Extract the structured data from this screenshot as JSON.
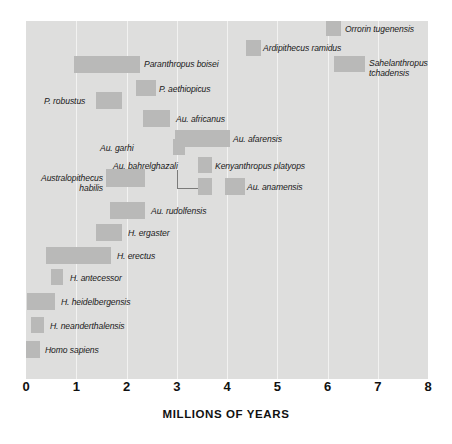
{
  "chart_data": {
    "type": "bar",
    "orientation": "horizontal-range",
    "title": "",
    "xlabel": "MILLIONS OF YEARS",
    "ylabel": "",
    "xlim": [
      0,
      8
    ],
    "x_ticks": [
      0,
      1,
      2,
      3,
      4,
      5,
      6,
      7,
      8
    ],
    "x_tick_labels": [
      "0",
      "1",
      "2",
      "3",
      "4",
      "5",
      "6",
      "7",
      "8"
    ],
    "grid": true,
    "grid_axis": "x",
    "legend": "none",
    "note": "Each bar is a temporal range (start = younger, end = older) in millions of years before present; the x axis increases to the right toward older dates.",
    "colors": {
      "plot_background": "#dededd",
      "bar_fill": "#b9b9b8",
      "gridline": "#f2f2f1",
      "text": "#1a1a1a",
      "axis_text": "#111111",
      "connector": "#7b7b7a",
      "page_background": "#ffffff"
    },
    "categories": [
      "Orrorin tugenensis",
      "Ardipithecus ramidus",
      "Sahelanthropus tchadensis",
      "Paranthropus boisei",
      "P. aethiopicus",
      "P. robustus",
      "Au. africanus",
      "Au. afarensis",
      "Au. garhi",
      "Kenyanthropus platyops",
      "Au. bahrelghazali",
      "Australopithecus habilis",
      "Au. anamensis",
      "Au. rudolfensis",
      "H. ergaster",
      "H. erectus",
      "H. antecessor",
      "H. heidelbergensis",
      "H. neanderthalensis",
      "Homo sapiens"
    ],
    "bars": [
      {
        "name": "Orrorin tugenensis",
        "start": 5.98,
        "end": 6.28
      },
      {
        "name": "Ardipithecus ramidus",
        "start": 4.38,
        "end": 4.68
      },
      {
        "name": "Sahelanthropus tchadensis",
        "start": 6.14,
        "end": 6.76
      },
      {
        "name": "Paranthropus boisei",
        "start": 0.96,
        "end": 2.27
      },
      {
        "name": "P. aethiopicus",
        "start": 2.19,
        "end": 2.59
      },
      {
        "name": "P. robustus",
        "start": 1.39,
        "end": 1.91
      },
      {
        "name": "Au. africanus",
        "start": 2.33,
        "end": 2.87
      },
      {
        "name": "Au. afarensis",
        "start": 2.97,
        "end": 4.06
      },
      {
        "name": "Au. garhi",
        "start": 2.93,
        "end": 3.17
      },
      {
        "name": "Kenyanthropus platyops",
        "start": 3.42,
        "end": 3.7
      },
      {
        "name": "Au. bahrelghazali",
        "start": 3.42,
        "end": 3.7
      },
      {
        "name": "Australopithecus habilis",
        "start": 1.59,
        "end": 2.37
      },
      {
        "name": "Au. anamensis",
        "start": 3.96,
        "end": 4.36
      },
      {
        "name": "Au. rudolfensis",
        "start": 1.67,
        "end": 2.37
      },
      {
        "name": "H. ergaster",
        "start": 1.39,
        "end": 1.91
      },
      {
        "name": "H. erectus",
        "start": 0.4,
        "end": 1.69
      },
      {
        "name": "H. antecessor",
        "start": 0.5,
        "end": 0.74
      },
      {
        "name": "H. heidelbergensis",
        "start": 0.02,
        "end": 0.58
      },
      {
        "name": "H. neanderthalensis",
        "start": 0.1,
        "end": 0.36
      },
      {
        "name": "Homo sapiens",
        "start": 0.0,
        "end": 0.28
      }
    ],
    "label_positions": [
      {
        "name": "Orrorin tugenensis",
        "left": 345,
        "top": 24,
        "align": "left",
        "lines": [
          "Orrorin tugenensis"
        ]
      },
      {
        "name": "Ardipithecus ramidus",
        "left": 263,
        "top": 43,
        "align": "left",
        "lines": [
          "Ardipithecus ramidus"
        ]
      },
      {
        "name": "Sahelanthropus tchadensis",
        "left": 369,
        "top": 58,
        "align": "left",
        "lines": [
          "Sahelanthropus",
          "tchadensis"
        ]
      },
      {
        "name": "Paranthropus boisei",
        "left": 144,
        "top": 59,
        "align": "left",
        "lines": [
          "Paranthropus boisei"
        ]
      },
      {
        "name": "P. aethiopicus",
        "left": 159,
        "top": 84,
        "align": "left",
        "lines": [
          "P. aethiopicus"
        ]
      },
      {
        "name": "P. robustus",
        "left": 44,
        "top": 96,
        "align": "left",
        "lines": [
          "P. robustus"
        ]
      },
      {
        "name": "Au. africanus",
        "left": 176,
        "top": 114,
        "align": "left",
        "lines": [
          "Au. africanus"
        ]
      },
      {
        "name": "Au. afarensis",
        "left": 233,
        "top": 134,
        "align": "left",
        "lines": [
          "Au. afarensis"
        ]
      },
      {
        "name": "Au. garhi",
        "left": 100,
        "top": 143,
        "align": "left",
        "lines": [
          "Au. garhi"
        ]
      },
      {
        "name": "Kenyanthropus platyops",
        "left": 215,
        "top": 161,
        "align": "left",
        "lines": [
          "Kenyanthropus platyops"
        ]
      },
      {
        "name": "Au. bahrelghazali",
        "left": 113,
        "top": 161,
        "align": "left",
        "lines": [
          "Au. bahrelghazali"
        ]
      },
      {
        "name": "Australopithecus habilis",
        "left": 31,
        "top": 173,
        "align": "right",
        "lines": [
          "Australopithecus",
          "habilis"
        ],
        "width": 72
      },
      {
        "name": "Au. anamensis",
        "left": 247,
        "top": 182,
        "align": "left",
        "lines": [
          "Au. anamensis"
        ]
      },
      {
        "name": "Au. rudolfensis",
        "left": 151,
        "top": 206,
        "align": "left",
        "lines": [
          "Au. rudolfensis"
        ]
      },
      {
        "name": "H. ergaster",
        "left": 128,
        "top": 228,
        "align": "left",
        "lines": [
          "H. ergaster"
        ]
      },
      {
        "name": "H. erectus",
        "left": 117,
        "top": 251,
        "align": "left",
        "lines": [
          "H. erectus"
        ]
      },
      {
        "name": "H. antecessor",
        "left": 70,
        "top": 273,
        "align": "left",
        "lines": [
          "H. antecessor"
        ]
      },
      {
        "name": "H. heidelbergensis",
        "left": 61,
        "top": 297,
        "align": "left",
        "lines": [
          "H. heidelbergensis"
        ]
      },
      {
        "name": "H. neanderthalensis",
        "left": 50,
        "top": 321,
        "align": "left",
        "lines": [
          "H. neanderthalensis"
        ]
      },
      {
        "name": "Homo sapiens",
        "left": 45,
        "top": 345,
        "align": "left",
        "lines": [
          "Homo sapiens"
        ]
      }
    ],
    "bar_geometry": [
      {
        "name": "Orrorin tugenensis",
        "left": 326,
        "top": 21,
        "width": 15,
        "height": 15
      },
      {
        "name": "Ardipithecus ramidus",
        "left": 246,
        "top": 40,
        "width": 15,
        "height": 16
      },
      {
        "name": "Sahelanthropus tchadensis",
        "left": 334,
        "top": 56,
        "width": 31,
        "height": 16
      },
      {
        "name": "Paranthropus boisei",
        "left": 74,
        "top": 56,
        "width": 66,
        "height": 17
      },
      {
        "name": "P. aethiopicus",
        "left": 136,
        "top": 80,
        "width": 20,
        "height": 16
      },
      {
        "name": "P. robustus",
        "left": 96,
        "top": 92,
        "width": 26,
        "height": 17
      },
      {
        "name": "Au. africanus",
        "left": 143,
        "top": 110,
        "width": 27,
        "height": 17
      },
      {
        "name": "Au. afarensis",
        "left": 175,
        "top": 130,
        "width": 55,
        "height": 17
      },
      {
        "name": "Au. garhi",
        "left": 173,
        "top": 139,
        "width": 12,
        "height": 16
      },
      {
        "name": "Kenyanthropus platyops",
        "left": 198,
        "top": 157,
        "width": 14,
        "height": 16
      },
      {
        "name": "Australopithecus habilis",
        "left": 106,
        "top": 169,
        "width": 39,
        "height": 18
      },
      {
        "name": "Au. bahrelghazali",
        "left": 198,
        "top": 178,
        "width": 14,
        "height": 17
      },
      {
        "name": "Au. anamensis",
        "left": 225,
        "top": 178,
        "width": 20,
        "height": 17
      },
      {
        "name": "Au. rudolfensis",
        "left": 110,
        "top": 202,
        "width": 35,
        "height": 17
      },
      {
        "name": "H. ergaster",
        "left": 96,
        "top": 224,
        "width": 26,
        "height": 17
      },
      {
        "name": "H. erectus",
        "left": 46,
        "top": 247,
        "width": 65,
        "height": 17
      },
      {
        "name": "H. antecessor",
        "left": 51,
        "top": 269,
        "width": 12,
        "height": 16
      },
      {
        "name": "H. heidelbergensis",
        "left": 27,
        "top": 293,
        "width": 28,
        "height": 17
      },
      {
        "name": "H. neanderthalensis",
        "left": 31,
        "top": 317,
        "width": 13,
        "height": 16
      },
      {
        "name": "Homo sapiens",
        "left": 26,
        "top": 341,
        "width": 14,
        "height": 17
      }
    ],
    "connector": {
      "x": 177,
      "y_top": 170,
      "y_bottom": 188,
      "x_end": 198
    }
  },
  "axis": {
    "title": "MILLIONS OF YEARS"
  }
}
